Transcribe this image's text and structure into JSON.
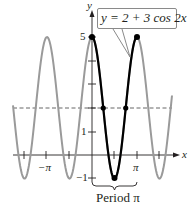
{
  "chart_data": {
    "type": "line",
    "title": "",
    "function": "y = 2 + 3 cos 2x",
    "xlabel": "x",
    "ylabel": "y",
    "x_ticks": [
      "-3π/2",
      "-π",
      "-π/2",
      "π/2",
      "π",
      "3π/2"
    ],
    "x_tick_labels": [
      "-π",
      "π"
    ],
    "y_ticks": [
      -1,
      1,
      2,
      3,
      4,
      5
    ],
    "y_tick_labels": [
      "5",
      "1",
      "-1"
    ],
    "xlim": [
      -3.6,
      3.6
    ],
    "ylim": [
      -1,
      5
    ],
    "midline": 2,
    "amplitude": 3,
    "period": "π",
    "highlighted_period": [
      0,
      3.14159
    ],
    "key_points": [
      {
        "x": "0",
        "y": 5
      },
      {
        "x": "π/4",
        "y": 2
      },
      {
        "x": "π/2",
        "y": -1
      },
      {
        "x": "3π/4",
        "y": 2
      },
      {
        "x": "π",
        "y": 5
      }
    ],
    "colors": {
      "one_period": "#000000",
      "other_periods": "#9a9a9a",
      "axes": "#231f20"
    }
  },
  "labels": {
    "equation": "y = 2 + 3 cos 2x",
    "y_axis": "y",
    "x_axis": "x",
    "tick_5": "5",
    "tick_1": "1",
    "tick_neg1": "−1",
    "tick_neg_pi": "−π",
    "tick_pi": "π",
    "period": "Period π"
  }
}
